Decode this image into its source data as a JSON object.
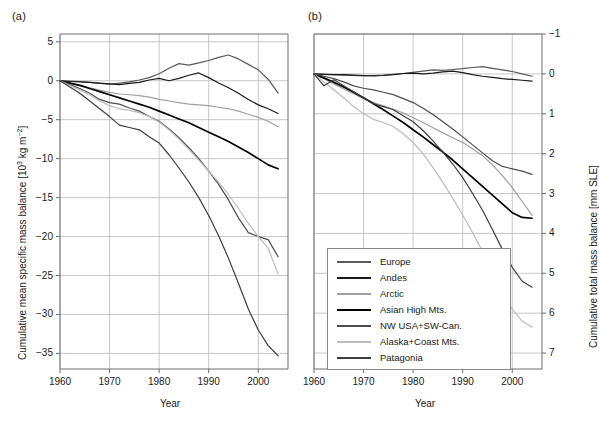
{
  "figure": {
    "panels": [
      {
        "tag": "panel-a",
        "label": "(a)"
      },
      {
        "tag": "panel-b",
        "label": "(b)"
      }
    ],
    "xlabel": "Year",
    "ylabel_left": "Cumulative mean specific mass balance [10",
    "ylabel_left_sup": "3",
    "ylabel_left_tail": " kg m",
    "ylabel_left_sup2": "−2",
    "ylabel_left_close": "]",
    "ylabel_right": "Cumulative total mass balance [mm SLE]",
    "xticks": [
      "1960",
      "1970",
      "1980",
      "1990",
      "2000"
    ],
    "yticks_left": [
      "5",
      "0",
      "−5",
      "−10",
      "−15",
      "−20",
      "−25",
      "−30",
      "−35"
    ],
    "yticks_right": [
      "−1",
      "0",
      "1",
      "2",
      "3",
      "4",
      "5",
      "6",
      "7"
    ]
  },
  "legend": {
    "position": "center-bottom",
    "entries": [
      {
        "label": "Europe",
        "color": "#595959"
      },
      {
        "label": "Andes",
        "color": "#1a1a1a"
      },
      {
        "label": "Arctic",
        "color": "#a0a0a0"
      },
      {
        "label": "Asian High Mts.",
        "color": "#000000"
      },
      {
        "label": "NW USA+SW-Can.",
        "color": "#4d4d4d"
      },
      {
        "label": "Alaska+Coast Mts.",
        "color": "#bdbdbd"
      },
      {
        "label": "Patagonia",
        "color": "#3d3d3d"
      }
    ]
  },
  "chart_data": [
    {
      "type": "line",
      "panel": "(a)",
      "title": "",
      "xlabel": "Year",
      "ylabel": "Cumulative mean specific mass balance [10^3 kg m^-2]",
      "xlim": [
        1960,
        2006
      ],
      "ylim": [
        -37,
        6
      ],
      "grid": true,
      "xticks": [
        1960,
        1970,
        1980,
        1990,
        2000
      ],
      "yticks": [
        5,
        0,
        -5,
        -10,
        -15,
        -20,
        -25,
        -30,
        -35
      ],
      "x": [
        1960,
        1962,
        1964,
        1966,
        1968,
        1970,
        1972,
        1974,
        1976,
        1978,
        1980,
        1982,
        1984,
        1986,
        1988,
        1990,
        1992,
        1994,
        1996,
        1998,
        2000,
        2002,
        2004
      ],
      "series": [
        {
          "name": "Europe",
          "color": "#595959",
          "values": [
            0,
            -0.05,
            -0.1,
            -0.2,
            -0.35,
            -0.45,
            -0.3,
            -0.15,
            0.1,
            0.4,
            0.9,
            1.6,
            2.2,
            2.0,
            2.3,
            2.6,
            3.0,
            3.3,
            2.8,
            2.1,
            1.4,
            0.2,
            -1.6
          ]
        },
        {
          "name": "Andes",
          "color": "#1a1a1a",
          "values": [
            0,
            -0.1,
            -0.15,
            -0.2,
            -0.3,
            -0.4,
            -0.5,
            -0.35,
            -0.2,
            0.1,
            0.3,
            0.0,
            0.3,
            0.7,
            1.0,
            0.4,
            -0.3,
            -0.9,
            -1.6,
            -2.4,
            -3.1,
            -3.6,
            -4.2
          ]
        },
        {
          "name": "Arctic",
          "color": "#a0a0a0",
          "values": [
            0,
            -0.3,
            -0.6,
            -0.9,
            -1.2,
            -1.5,
            -1.7,
            -1.8,
            -1.9,
            -2.1,
            -2.4,
            -2.6,
            -2.8,
            -3.0,
            -3.1,
            -3.2,
            -3.4,
            -3.6,
            -3.9,
            -4.3,
            -4.7,
            -5.2,
            -5.9
          ]
        },
        {
          "name": "Asian High Mts.",
          "color": "#000000",
          "values": [
            0,
            -0.3,
            -0.6,
            -1.0,
            -1.4,
            -1.8,
            -2.2,
            -2.6,
            -3.0,
            -3.4,
            -3.9,
            -4.4,
            -4.9,
            -5.4,
            -6.0,
            -6.6,
            -7.2,
            -7.8,
            -8.5,
            -9.2,
            -10.0,
            -10.8,
            -11.3
          ]
        },
        {
          "name": "NW USA+SW-Can.",
          "color": "#4d4d4d",
          "values": [
            0,
            -0.5,
            -1.0,
            -1.6,
            -2.4,
            -2.8,
            -3.0,
            -3.5,
            -3.9,
            -4.6,
            -5.2,
            -6.2,
            -7.3,
            -8.6,
            -10.0,
            -11.6,
            -13.3,
            -15.3,
            -17.6,
            -19.5,
            -20.0,
            -20.4,
            -22.6
          ]
        },
        {
          "name": "Alaska+Coast Mts.",
          "color": "#bdbdbd",
          "values": [
            0,
            -0.6,
            -1.2,
            -1.8,
            -2.6,
            -3.2,
            -3.6,
            -3.8,
            -4.1,
            -4.6,
            -5.3,
            -6.3,
            -7.5,
            -8.8,
            -10.2,
            -11.6,
            -13.0,
            -14.6,
            -16.4,
            -18.3,
            -20.0,
            -21.5,
            -24.8
          ]
        },
        {
          "name": "Patagonia",
          "color": "#3d3d3d",
          "values": [
            0,
            -0.8,
            -1.6,
            -2.6,
            -3.6,
            -4.6,
            -5.7,
            -6.0,
            -6.3,
            -7.2,
            -8.0,
            -9.5,
            -11.2,
            -13.0,
            -15.0,
            -17.3,
            -19.9,
            -22.8,
            -26.0,
            -29.3,
            -32.0,
            -34.0,
            -35.3
          ]
        }
      ]
    },
    {
      "type": "line",
      "panel": "(b)",
      "title": "",
      "xlabel": "Year",
      "ylabel": "Cumulative total mass balance [mm SLE]",
      "xlim": [
        1960,
        2006
      ],
      "ylim": [
        -1,
        7.4
      ],
      "y_inverted": true,
      "grid": true,
      "xticks": [
        1960,
        1970,
        1980,
        1990,
        2000
      ],
      "yticks": [
        -1,
        0,
        1,
        2,
        3,
        4,
        5,
        6,
        7
      ],
      "x": [
        1960,
        1962,
        1964,
        1966,
        1968,
        1970,
        1972,
        1974,
        1976,
        1978,
        1980,
        1982,
        1984,
        1986,
        1988,
        1990,
        1992,
        1994,
        1996,
        1998,
        2000,
        2002,
        2004
      ],
      "series": [
        {
          "name": "Europe",
          "color": "#595959",
          "values": [
            0,
            0.01,
            0.02,
            0.03,
            0.04,
            0.05,
            0.04,
            0.03,
            0.01,
            -0.01,
            -0.04,
            -0.07,
            -0.1,
            -0.09,
            -0.11,
            -0.13,
            -0.16,
            -0.18,
            -0.14,
            -0.1,
            -0.06,
            0.0,
            0.06
          ]
        },
        {
          "name": "Andes",
          "color": "#1a1a1a",
          "values": [
            0,
            0.01,
            0.02,
            0.02,
            0.03,
            0.04,
            0.05,
            0.04,
            0.02,
            -0.01,
            -0.02,
            0.0,
            -0.02,
            -0.05,
            -0.07,
            -0.03,
            0.02,
            0.06,
            0.09,
            0.12,
            0.14,
            0.16,
            0.18
          ]
        },
        {
          "name": "Arctic",
          "color": "#a0a0a0",
          "values": [
            0,
            0.12,
            0.25,
            0.38,
            0.5,
            0.62,
            0.72,
            0.8,
            0.88,
            0.98,
            1.1,
            1.22,
            1.35,
            1.48,
            1.6,
            1.72,
            1.88,
            2.05,
            2.28,
            2.55,
            2.85,
            3.2,
            3.55
          ]
        },
        {
          "name": "Asian High Mts.",
          "color": "#000000",
          "values": [
            0,
            0.1,
            0.21,
            0.33,
            0.46,
            0.6,
            0.75,
            0.9,
            1.06,
            1.22,
            1.4,
            1.58,
            1.77,
            1.96,
            2.16,
            2.38,
            2.6,
            2.82,
            3.04,
            3.26,
            3.48,
            3.6,
            3.62
          ]
        },
        {
          "name": "NW USA+SW-Can.",
          "color": "#4d4d4d",
          "values": [
            0,
            0.06,
            0.12,
            0.2,
            0.3,
            0.36,
            0.4,
            0.46,
            0.52,
            0.62,
            0.72,
            0.86,
            1.02,
            1.2,
            1.38,
            1.58,
            1.78,
            1.98,
            2.18,
            2.32,
            2.38,
            2.44,
            2.52
          ]
        },
        {
          "name": "Alaska+Coast Mts.",
          "color": "#bdbdbd",
          "values": [
            0,
            0.2,
            0.4,
            0.6,
            0.82,
            1.0,
            1.14,
            1.22,
            1.32,
            1.5,
            1.72,
            2.0,
            2.35,
            2.72,
            3.12,
            3.54,
            3.98,
            4.45,
            4.95,
            5.45,
            5.9,
            6.2,
            6.35
          ]
        },
        {
          "name": "Patagonia",
          "color": "#3d3d3d",
          "values": [
            0,
            0.3,
            0.15,
            0.3,
            0.45,
            0.6,
            0.75,
            0.82,
            0.9,
            1.05,
            1.2,
            1.42,
            1.68,
            1.96,
            2.26,
            2.6,
            3.0,
            3.42,
            3.9,
            4.4,
            4.85,
            5.2,
            5.35
          ]
        }
      ]
    }
  ]
}
